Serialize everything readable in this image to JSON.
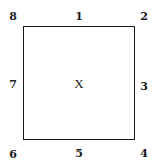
{
  "diagram": {
    "center_label": "X",
    "positions": {
      "top_left": "8",
      "top": "1",
      "top_right": "2",
      "right": "3",
      "bottom_right": "4",
      "bottom": "5",
      "bottom_left": "6",
      "left": "7"
    }
  }
}
